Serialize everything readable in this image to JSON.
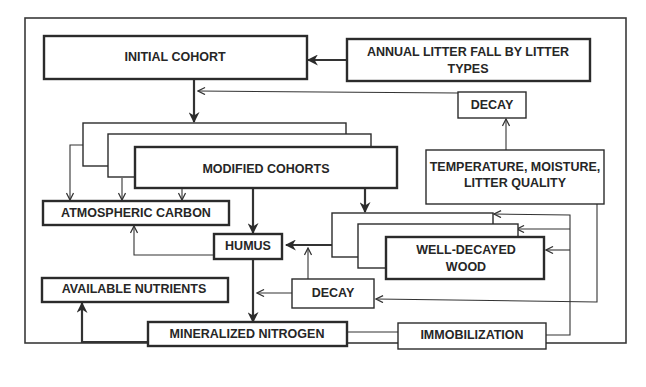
{
  "diagram": {
    "nodes": {
      "initial_cohort": "INITIAL COHORT",
      "annual_litter_line1": "ANNUAL LITTER FALL BY LITTER",
      "annual_litter_line2": "TYPES",
      "decay_top": "DECAY",
      "modified_cohorts": "MODIFIED COHORTS",
      "temp_line1": "TEMPERATURE, MOISTURE,",
      "temp_line2": "LITTER QUALITY",
      "atmospheric_carbon": "ATMOSPHERIC CARBON",
      "humus": "HUMUS",
      "wood_line1": "WELL-DECAYED",
      "wood_line2": "WOOD",
      "available_nutrients": "AVAILABLE NUTRIENTS",
      "decay_bottom": "DECAY",
      "mineralized_nitrogen": "MINERALIZED NITROGEN",
      "immobilization": "IMMOBILIZATION"
    },
    "edges": [
      {
        "from": "ANNUAL LITTER FALL BY LITTER TYPES",
        "to": "INITIAL COHORT"
      },
      {
        "from": "DECAY",
        "to": "INITIAL COHORT -> MODIFIED COHORTS"
      },
      {
        "from": "TEMPERATURE, MOISTURE, LITTER QUALITY",
        "to": "DECAY"
      },
      {
        "from": "INITIAL COHORT",
        "to": "MODIFIED COHORTS"
      },
      {
        "from": "MODIFIED COHORTS",
        "to": "ATMOSPHERIC CARBON"
      },
      {
        "from": "MODIFIED COHORTS",
        "to": "HUMUS"
      },
      {
        "from": "MODIFIED COHORTS",
        "to": "WELL-DECAYED WOOD"
      },
      {
        "from": "HUMUS",
        "to": "ATMOSPHERIC CARBON"
      },
      {
        "from": "WELL-DECAYED WOOD",
        "to": "HUMUS"
      },
      {
        "from": "DECAY",
        "to": "WELL-DECAYED WOOD -> HUMUS"
      },
      {
        "from": "DECAY",
        "to": "HUMUS -> MINERALIZED NITROGEN"
      },
      {
        "from": "TEMPERATURE, MOISTURE, LITTER QUALITY",
        "to": "DECAY"
      },
      {
        "from": "HUMUS",
        "to": "MINERALIZED NITROGEN"
      },
      {
        "from": "MINERALIZED NITROGEN",
        "to": "AVAILABLE NUTRIENTS"
      },
      {
        "from": "MINERALIZED NITROGEN",
        "to": "IMMOBILIZATION"
      },
      {
        "from": "IMMOBILIZATION",
        "to": "WELL-DECAYED WOOD"
      }
    ]
  }
}
